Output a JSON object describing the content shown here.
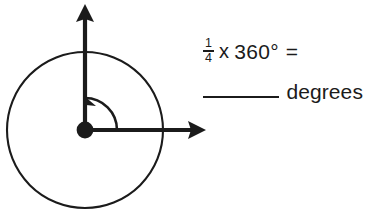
{
  "worksheet": {
    "problem": {
      "fraction": {
        "numerator": "1",
        "denominator": "4"
      },
      "times_symbol": "x",
      "operand": "360°",
      "equals_symbol": "=",
      "answer_blank": "",
      "unit_label": "degrees"
    },
    "figure": {
      "description": "circle with vertex dot, vertical ray up, horizontal ray right, counterclockwise angle arc",
      "vertex_label": "",
      "ray_vertical_direction": "up",
      "ray_horizontal_direction": "right",
      "arc_direction": "counterclockwise",
      "arc_arrowhead": "at-vertical-ray",
      "angle_degrees": "90",
      "stroke_color": "#1b1b1b",
      "background_color": "#ffffff"
    }
  }
}
